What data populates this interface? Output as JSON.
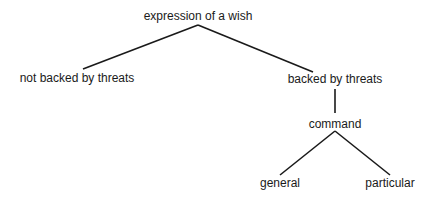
{
  "diagram": {
    "type": "tree",
    "nodes": [
      {
        "id": "root",
        "label": "expression of a wish",
        "x": 198,
        "y": 9
      },
      {
        "id": "not_backed",
        "label": "not backed by threats",
        "x": 77,
        "y": 71
      },
      {
        "id": "backed",
        "label": "backed by threats",
        "x": 335,
        "y": 72
      },
      {
        "id": "command",
        "label": "command",
        "x": 335,
        "y": 117
      },
      {
        "id": "general",
        "label": "general",
        "x": 280,
        "y": 176
      },
      {
        "id": "particular",
        "label": "particular",
        "x": 390,
        "y": 176
      }
    ],
    "edges": [
      {
        "from": "root",
        "to": "not_backed"
      },
      {
        "from": "root",
        "to": "backed"
      },
      {
        "from": "backed",
        "to": "command"
      },
      {
        "from": "command",
        "to": "general"
      },
      {
        "from": "command",
        "to": "particular"
      }
    ],
    "line_color": "#1a1a1a"
  }
}
